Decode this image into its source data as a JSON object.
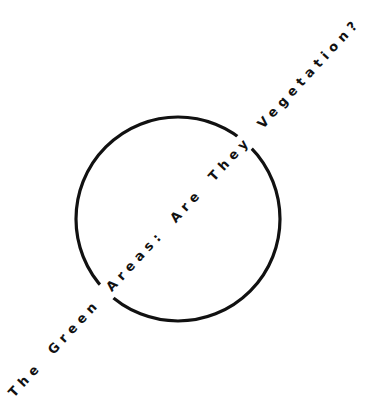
{
  "title": "The Green Areas: Are They Vegetation?",
  "figure": {
    "shape": "circle-outline",
    "stroke_color": "#111111",
    "background": "#ffffff"
  }
}
